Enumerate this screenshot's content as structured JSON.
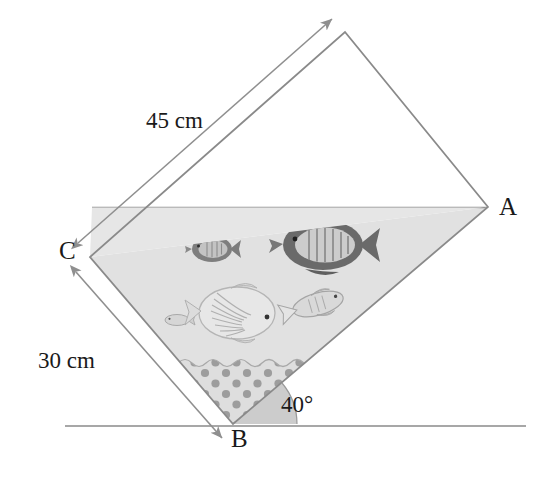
{
  "figure": {
    "kind": "geometry-diagram",
    "vertices": [
      {
        "name": "A",
        "label": "A",
        "x": 488,
        "y": 207
      },
      {
        "name": "B",
        "label": "B",
        "x": 233,
        "y": 424
      },
      {
        "name": "C",
        "label": "C",
        "x": 90,
        "y": 257
      },
      {
        "name": "D",
        "label": "",
        "x": 345,
        "y": 32
      }
    ],
    "dimensions": [
      {
        "name": "side-CD",
        "label": "45 cm",
        "value": 45,
        "unit": "cm"
      },
      {
        "name": "side-CB",
        "label": "30 cm",
        "value": 30,
        "unit": "cm"
      }
    ],
    "angle": {
      "label": "40°",
      "value": 40,
      "unit": "degrees",
      "at": "B"
    },
    "waterline": {
      "label": "",
      "y": 207
    },
    "ground": {
      "label": "",
      "y": 426,
      "x1": 65,
      "x2": 526
    },
    "colors": {
      "outline": "#8a8a8a",
      "water": "#e0e0e0",
      "gravel": "#dcdcdc",
      "gravel_dot": "#9a9a9a",
      "angle_fill": "#c8c8c8",
      "dimension_line": "#8f8f8f",
      "ground_line": "#8a8a8a",
      "text": "#1a1a1a",
      "fish_dark": "#6e6e6e",
      "fish_light": "#cfcfcf"
    },
    "fish": [
      {
        "name": "fish-small-upper-left",
        "x": 212,
        "y": 249,
        "size": 34,
        "tone": "dark",
        "facing": "left"
      },
      {
        "name": "fish-large-dark-upper-right",
        "x": 323,
        "y": 245,
        "size": 78,
        "tone": "dark",
        "facing": "left"
      },
      {
        "name": "fish-tiny-left",
        "x": 177,
        "y": 320,
        "size": 20,
        "tone": "light",
        "facing": "left"
      },
      {
        "name": "fish-large-light-center",
        "x": 237,
        "y": 313,
        "size": 72,
        "tone": "light",
        "facing": "right"
      },
      {
        "name": "fish-medium-right",
        "x": 318,
        "y": 304,
        "size": 50,
        "tone": "light",
        "facing": "right"
      }
    ]
  }
}
